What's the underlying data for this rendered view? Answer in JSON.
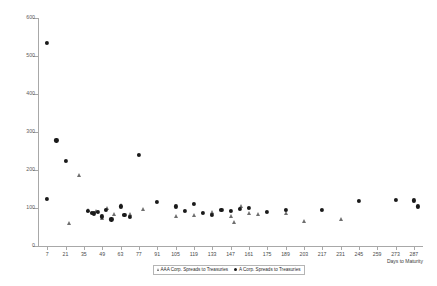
{
  "chart_data": {
    "type": "scatter",
    "title": "",
    "xlabel": "Days to Maturity",
    "ylabel": "",
    "xlim": [
      0,
      294
    ],
    "ylim": [
      0,
      600
    ],
    "grid": false,
    "legend_position": "bottom",
    "xticks": [
      7,
      21,
      35,
      49,
      63,
      77,
      91,
      105,
      119,
      133,
      147,
      161,
      175,
      189,
      203,
      217,
      231,
      245,
      259,
      273,
      287
    ],
    "yticks": [
      0,
      100,
      200,
      300,
      400,
      500,
      600
    ],
    "series": [
      {
        "name": "AAA Corp. Spreads to Treasuries",
        "marker": "triangle",
        "color": "#6f6f6f",
        "points": [
          [
            24,
            60
          ],
          [
            31,
            188
          ],
          [
            38,
            96
          ],
          [
            44,
            92
          ],
          [
            49,
            75
          ],
          [
            53,
            100
          ],
          [
            58,
            84
          ],
          [
            63,
            108
          ],
          [
            70,
            85
          ],
          [
            80,
            98
          ],
          [
            105,
            80
          ],
          [
            119,
            82
          ],
          [
            133,
            90
          ],
          [
            147,
            78
          ],
          [
            150,
            64
          ],
          [
            155,
            104
          ],
          [
            161,
            86
          ],
          [
            168,
            84
          ],
          [
            189,
            86
          ],
          [
            203,
            66
          ],
          [
            231,
            72
          ]
        ]
      },
      {
        "name": "A Corp. Spreads to Treasuries",
        "marker": "circle",
        "color": "#1a1a1a",
        "points": [
          [
            7,
            534
          ],
          [
            7,
            124
          ],
          [
            14,
            278
          ],
          [
            21,
            224
          ],
          [
            38,
            92
          ],
          [
            41,
            88
          ],
          [
            43,
            86
          ],
          [
            46,
            90
          ],
          [
            49,
            78
          ],
          [
            52,
            96
          ],
          [
            56,
            70
          ],
          [
            63,
            104
          ],
          [
            66,
            82
          ],
          [
            70,
            76
          ],
          [
            77,
            240
          ],
          [
            91,
            116
          ],
          [
            105,
            104
          ],
          [
            112,
            92
          ],
          [
            119,
            110
          ],
          [
            126,
            88
          ],
          [
            133,
            82
          ],
          [
            140,
            96
          ],
          [
            147,
            92
          ],
          [
            154,
            98
          ],
          [
            161,
            100
          ],
          [
            175,
            90
          ],
          [
            189,
            96
          ],
          [
            217,
            94
          ],
          [
            245,
            118
          ],
          [
            273,
            122
          ],
          [
            287,
            120
          ],
          [
            290,
            104
          ]
        ]
      }
    ]
  }
}
